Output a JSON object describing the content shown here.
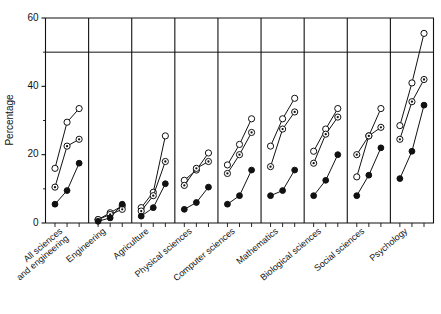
{
  "chart_data": {
    "type": "line",
    "title": "",
    "xlabel": "",
    "ylabel": "Percentage",
    "ylim": [
      0,
      60
    ],
    "yticks": [
      0,
      20,
      40,
      60
    ],
    "ytick_labels": [
      "0",
      "20",
      "40",
      "60"
    ],
    "grid": false,
    "legend_position": "none",
    "reference_lines": [
      {
        "axis": "y",
        "value": 50,
        "style": "solid"
      }
    ],
    "panels": true,
    "points_per_panel": 3,
    "categories": [
      "All sciences and engineering",
      "Engineering",
      "Agriculture",
      "Physical sciences",
      "Computer sciences",
      "Mathematics",
      "Biological sciences",
      "Social sciences",
      "Psychology"
    ],
    "series": [
      {
        "name": "open-circle",
        "marker": "open circle",
        "values": [
          [
            16.0,
            29.5,
            33.5
          ],
          [
            1.0,
            3.0,
            5.0
          ],
          [
            4.5,
            9.0,
            25.5
          ],
          [
            12.5,
            15.5,
            20.5
          ],
          [
            17.0,
            23.0,
            30.5
          ],
          [
            22.5,
            30.5,
            36.5
          ],
          [
            21.0,
            27.5,
            33.5
          ],
          [
            13.5,
            25.5,
            33.5
          ],
          [
            28.5,
            41.0,
            55.5
          ]
        ]
      },
      {
        "name": "half-filled-circle",
        "marker": "circle with center dot",
        "values": [
          [
            10.5,
            22.5,
            24.5
          ],
          [
            1.0,
            2.5,
            4.0
          ],
          [
            3.5,
            8.0,
            18.0
          ],
          [
            11.0,
            16.0,
            18.0
          ],
          [
            14.5,
            20.0,
            26.5
          ],
          [
            16.5,
            27.5,
            32.5
          ],
          [
            17.5,
            26.0,
            31.0
          ],
          [
            20.0,
            25.5,
            28.0
          ],
          [
            24.5,
            35.5,
            42.0
          ]
        ]
      },
      {
        "name": "filled-circle",
        "marker": "filled circle",
        "values": [
          [
            5.5,
            9.5,
            17.5
          ],
          [
            0.5,
            1.5,
            5.5
          ],
          [
            2.0,
            4.5,
            11.5
          ],
          [
            4.0,
            6.0,
            10.5
          ],
          [
            5.5,
            8.0,
            15.5
          ],
          [
            8.0,
            9.5,
            15.5
          ],
          [
            8.0,
            12.5,
            20.0
          ],
          [
            8.0,
            14.0,
            22.0
          ],
          [
            13.0,
            21.0,
            34.5
          ]
        ]
      }
    ]
  },
  "axes": {
    "y_title": "Percentage"
  }
}
